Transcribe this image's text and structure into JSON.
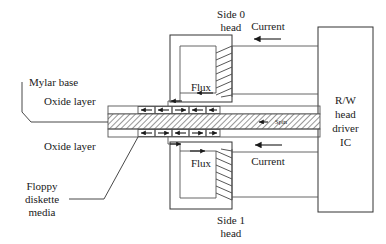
{
  "figure": {
    "bg_color": "#ffffff",
    "line_color": "#333333",
    "text_color": "#1a1a1a"
  },
  "labels": {
    "side0_head_line1": "Side 0",
    "side0_head_line2": "head",
    "side1_head_line1": "Side 1",
    "side1_head_line2": "head",
    "flux_top": "Flux",
    "flux_bottom": "Flux",
    "current_top": "Current",
    "current_bottom": "Current",
    "mylar_base": "Mylar base",
    "oxide_layer_top": "Oxide layer",
    "oxide_layer_bottom": "Oxide layer",
    "floppy_media_line1": "Floppy",
    "floppy_media_line2": "diskette",
    "floppy_media_line3": "media",
    "spin": "Spin",
    "driver_ic_line1": "R/W",
    "driver_ic_line2": "head",
    "driver_ic_line3": "driver",
    "driver_ic_line4": "IC"
  },
  "media": {
    "top_track_domains": [
      "left",
      "left",
      "right",
      "left",
      "left",
      "left"
    ],
    "bottom_track_domains": [
      "left",
      "right",
      "left",
      "right",
      "right",
      "right"
    ],
    "spin_direction": "left",
    "layers": [
      "Oxide layer",
      "Mylar base",
      "Oxide layer"
    ]
  },
  "heads": [
    {
      "id": "side-0",
      "label": "Side 0 head",
      "flux_arrow": "left",
      "current_arrow": "left",
      "position": "top"
    },
    {
      "id": "side-1",
      "label": "Side 1 head",
      "flux_arrow": "right",
      "current_arrow": "left",
      "position": "bottom"
    }
  ],
  "driver_ic": {
    "name": "R/W head driver IC",
    "connections": 4
  },
  "icons": {
    "flux_arrow_icon": "arrow-left",
    "current_arrow_icon": "arrow-left",
    "spin_arrow_icon": "arrow-left",
    "domain_arrow_icon": "arrow-magnetic-domain"
  }
}
